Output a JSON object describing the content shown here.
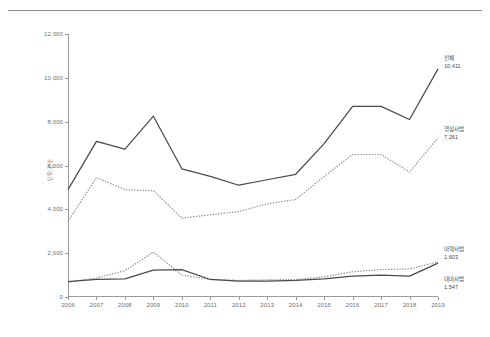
{
  "chart_data": {
    "type": "line",
    "title": "",
    "subtitle": "",
    "xlabel": "",
    "ylabel": "단위:건수",
    "x": [
      2006,
      2007,
      2008,
      2009,
      2010,
      2011,
      2012,
      2013,
      2014,
      2015,
      2016,
      2017,
      2018,
      2019
    ],
    "categories": [
      "2006",
      "2007",
      "2008",
      "2009",
      "2010",
      "2011",
      "2012",
      "2013",
      "2014",
      "2015",
      "2016",
      "2017",
      "2018",
      "2019"
    ],
    "ylim": [
      0,
      12000
    ],
    "yticks": [
      0,
      2000,
      4000,
      6000,
      8000,
      10000,
      12000
    ],
    "ytick_labels": [
      "0",
      "2,000",
      "4,000",
      "6,000",
      "8,000",
      "10,000",
      "12,000"
    ],
    "grid": false,
    "legend_position": "right-inline-endpoint",
    "series": [
      {
        "name": "전체",
        "style": "solid",
        "color": "#4a4a4a",
        "end_value_label": "10,411",
        "values": [
          4900,
          7100,
          6750,
          8250,
          5850,
          5500,
          5100,
          5350,
          5600,
          7000,
          8700,
          8700,
          8100,
          10411
        ]
      },
      {
        "name": "행정사범",
        "style": "dotted",
        "color": "#8d8d8d",
        "end_value_label": "7,261",
        "values": [
          3450,
          5450,
          4900,
          4850,
          3600,
          3750,
          3900,
          4250,
          4450,
          5500,
          6500,
          6500,
          5700,
          7261
        ]
      },
      {
        "name": "마약사범",
        "style": "dotted",
        "color": "#8d8d8d",
        "end_value_label": "1,603",
        "values": [
          680,
          870,
          1200,
          2050,
          1000,
          800,
          760,
          780,
          800,
          920,
          1150,
          1250,
          1280,
          1603
        ]
      },
      {
        "name": "대마사범",
        "style": "solid",
        "color": "#4a4a4a",
        "end_value_label": "1,547",
        "values": [
          700,
          800,
          830,
          1230,
          1250,
          800,
          720,
          730,
          760,
          830,
          950,
          1000,
          950,
          1547
        ]
      }
    ]
  },
  "axis": {
    "y_label": "단위:건수",
    "y_ticks": [
      "0",
      "2,000",
      "4,000",
      "6,000",
      "8,000",
      "10,000",
      "12,000"
    ],
    "x_ticks": [
      "2006",
      "2007",
      "2008",
      "2009",
      "2010",
      "2011",
      "2012",
      "2013",
      "2014",
      "2015",
      "2016",
      "2017",
      "2018",
      "2019"
    ]
  },
  "labels": {
    "total": {
      "name": "전체",
      "value": "10,411"
    },
    "admin": {
      "name": "행정사범",
      "value": "7,261"
    },
    "narcotics": {
      "name": "마약사범",
      "value": "1,603"
    },
    "cannabis": {
      "name": "대마사범",
      "value": "1,547"
    }
  }
}
